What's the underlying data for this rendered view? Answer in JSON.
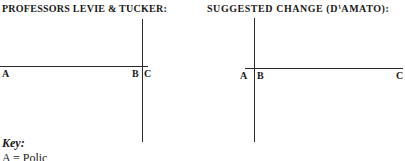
{
  "figures": [
    {
      "title": "PROFESSORS LEVIE & TUCKER:",
      "point_a": "A",
      "point_b": "B",
      "point_c": "C"
    },
    {
      "title": "SUGGESTED CHANGE (D'AMATO):",
      "point_a": "A",
      "point_b": "B",
      "point_c": "C"
    }
  ],
  "key": {
    "heading": "Key:",
    "first_entry_partial": "A = Polic"
  },
  "colors": {
    "ink": "#1a1a1a",
    "line": "#2b2b2b",
    "background": "#ffffff"
  }
}
